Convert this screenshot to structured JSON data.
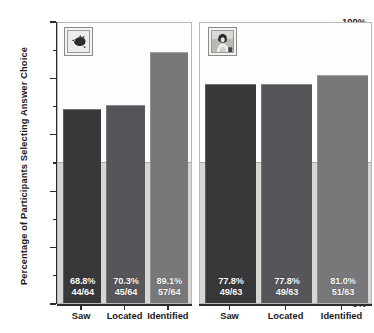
{
  "chart_data": {
    "type": "bar",
    "title": "",
    "xlabel": "",
    "ylabel": "Percentage of Participants Selecting Answer Choice",
    "ylim": [
      0,
      100
    ],
    "y_tick_labels": [
      "0%",
      "20%",
      "40%",
      "60%",
      "80%",
      "100%"
    ],
    "y_tick_values": [
      0,
      20,
      40,
      60,
      80,
      100
    ],
    "y_minor_tick_values": [
      10,
      30,
      50,
      70,
      90
    ],
    "grid": false,
    "legend": "none",
    "categories": [
      "Saw",
      "Located",
      "Identified"
    ],
    "panels": [
      {
        "id": "panel-0",
        "thumbnail_name": "dark-animal-stimulus-thumbnail",
        "denominator": 64,
        "bars": [
          {
            "category": "Saw",
            "value": 68.8,
            "percent_label": "68.8%",
            "fraction_label": "44/64",
            "numerator": 44,
            "denominator": 64,
            "color": "#38383a"
          },
          {
            "category": "Located",
            "value": 70.3,
            "percent_label": "70.3%",
            "fraction_label": "45/64",
            "numerator": 45,
            "denominator": 64,
            "color": "#56565a"
          },
          {
            "category": "Identified",
            "value": 89.1,
            "percent_label": "89.1%",
            "fraction_label": "57/64",
            "numerator": 57,
            "denominator": 64,
            "color": "#78787b"
          }
        ]
      },
      {
        "id": "panel-1",
        "thumbnail_name": "person-photo-stimulus-thumbnail",
        "denominator": 63,
        "bars": [
          {
            "category": "Saw",
            "value": 77.8,
            "percent_label": "77.8%",
            "fraction_label": "49/63",
            "numerator": 49,
            "denominator": 63,
            "color": "#38383a"
          },
          {
            "category": "Located",
            "value": 77.8,
            "percent_label": "77.8%",
            "fraction_label": "49/63",
            "numerator": 49,
            "denominator": 63,
            "color": "#56565a"
          },
          {
            "category": "Identified",
            "value": 81.0,
            "percent_label": "81.0%",
            "fraction_label": "51/63",
            "numerator": 51,
            "denominator": 63,
            "color": "#78787b"
          }
        ]
      }
    ],
    "background": {
      "upper_half_color": "#fdfdfd",
      "lower_half_color": "#d6d6d4",
      "split_at_percent": 50
    }
  }
}
